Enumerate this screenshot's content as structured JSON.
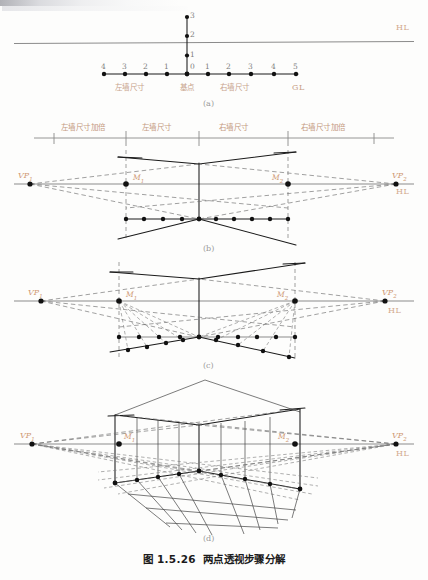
{
  "figure": {
    "caption_number": "图 1.5.26",
    "caption_title": "两点透视步骤分解",
    "panel_labels": [
      "(a)",
      "(b)",
      "(c)",
      "(d)"
    ]
  },
  "colors": {
    "ink": "#1a1a1a",
    "line_gray": "#808080",
    "label_orange": "#c8a48c",
    "vp_orange": "#d09a74",
    "dashed_gray": "#6e6e6e",
    "paper": "#fdfdfc"
  },
  "panel_a": {
    "label": "(a)",
    "horizon_label": "HL",
    "ground_label": "GL",
    "vertical_ticks": [
      "0",
      "1",
      "2",
      "3"
    ],
    "ground_ticks_left": [
      "4",
      "3",
      "2",
      "1"
    ],
    "ground_tick_origin": "0",
    "ground_ticks_right": [
      "1",
      "2",
      "3",
      "4",
      "5"
    ],
    "annotations": {
      "left_wall": "左墙尺寸",
      "base_point": "基点",
      "right_wall": "右墙尺寸"
    }
  },
  "panel_b": {
    "label": "(b)",
    "scale_segments": [
      "左墙尺寸加倍",
      "左墙尺寸",
      "右墙尺寸",
      "右墙尺寸加倍"
    ],
    "points": {
      "vp_left": "VP",
      "vp_left_sub": "1",
      "vp_right": "VP",
      "vp_right_sub": "2",
      "mp_left": "M",
      "mp_left_sub": "1",
      "mp_right": "M",
      "mp_right_sub": "2"
    },
    "horizon_label": "HL"
  },
  "panel_c": {
    "label": "(c)",
    "points": {
      "vp_left": "VP",
      "vp_left_sub": "1",
      "vp_right": "VP",
      "vp_right_sub": "2",
      "mp_left": "M",
      "mp_left_sub": "1",
      "mp_right": "M",
      "mp_right_sub": "2"
    },
    "horizon_label": "HL"
  },
  "panel_d": {
    "label": "(d)",
    "points": {
      "vp_left": "VP",
      "vp_left_sub": "1",
      "vp_right": "VP",
      "vp_right_sub": "2",
      "mp_left": "M",
      "mp_left_sub": "1",
      "mp_right": "M",
      "mp_right_sub": "2"
    },
    "horizon_label": "HL"
  }
}
